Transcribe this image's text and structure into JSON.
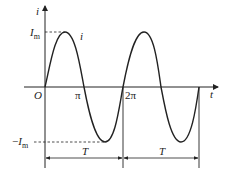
{
  "diagram": {
    "type": "sinusoidal-current-waveform",
    "axes": {
      "y_label": "i",
      "x_label": "t",
      "origin_label": "O"
    },
    "curve_label": "i",
    "amplitude_labels": {
      "positive": "I",
      "positive_sub": "m",
      "negative_prefix": "−",
      "negative": "I",
      "negative_sub": "m"
    },
    "x_ticks": [
      "π",
      "2π"
    ],
    "period_labels": [
      "T",
      "T"
    ],
    "colors": {
      "line": "#222222",
      "background": "#ffffff"
    }
  }
}
